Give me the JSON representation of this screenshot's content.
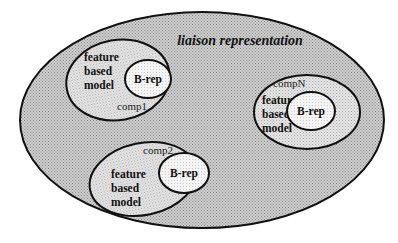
{
  "diagram": {
    "title": "liaison representation",
    "colors": {
      "outer_fill": "#c4c4c4",
      "component_fill": "#dedede",
      "brep_fill": "#f2f2f2",
      "stroke": "#111111"
    },
    "components": [
      {
        "name": "comp1",
        "model_lines": [
          "feature",
          "based",
          "model"
        ],
        "brep": "B-rep"
      },
      {
        "name": "compN",
        "model_lines": [
          "feature",
          "based",
          "model"
        ],
        "brep": "B-rep"
      },
      {
        "name": "comp2",
        "model_lines": [
          "feature",
          "based",
          "model"
        ],
        "brep": "B-rep"
      }
    ]
  }
}
